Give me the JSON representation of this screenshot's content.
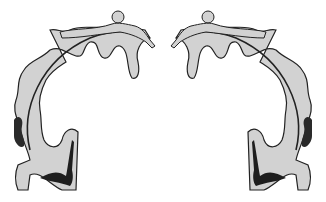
{
  "figure": {
    "panels": [
      {
        "id": "left",
        "side": "left-hemisphere"
      },
      {
        "id": "right",
        "side": "right-hemisphere"
      }
    ],
    "colors": {
      "background": "#ffffff",
      "cortex_fill": "#d2d2d2",
      "outline": "#222222",
      "dark_region": "#2a2a2a"
    }
  }
}
